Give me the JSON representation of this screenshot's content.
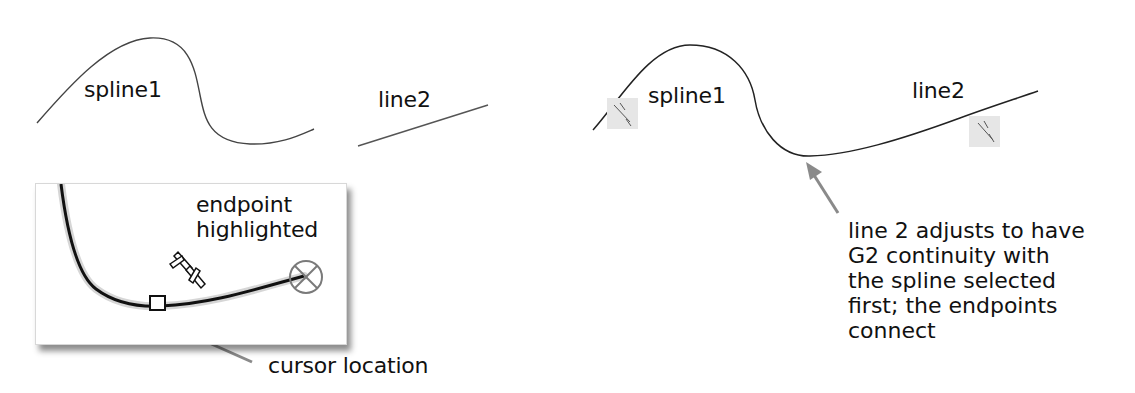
{
  "before": {
    "spline_label": "spline1",
    "line_label": "line2"
  },
  "inset": {
    "endpoint_label_line1": "endpoint",
    "endpoint_label_line2": "highlighted",
    "cursor_label": "cursor location",
    "icons": [
      "relation-icon",
      "endpoint-target-icon",
      "cursor-box-icon"
    ]
  },
  "after": {
    "spline_label": "spline1",
    "line_label": "line2",
    "icons": [
      "relation-badge-icon",
      "relation-badge-icon"
    ],
    "caption_lines": [
      "line 2 adjusts to have",
      "G2 continuity with",
      "the spline selected",
      "first; the endpoints",
      "connect"
    ]
  },
  "colors": {
    "curve": "#333333",
    "arrow": "#8a8a8a",
    "badge_bg": "#e6e6e6",
    "endpoint_marker": "#7a7a7a"
  }
}
